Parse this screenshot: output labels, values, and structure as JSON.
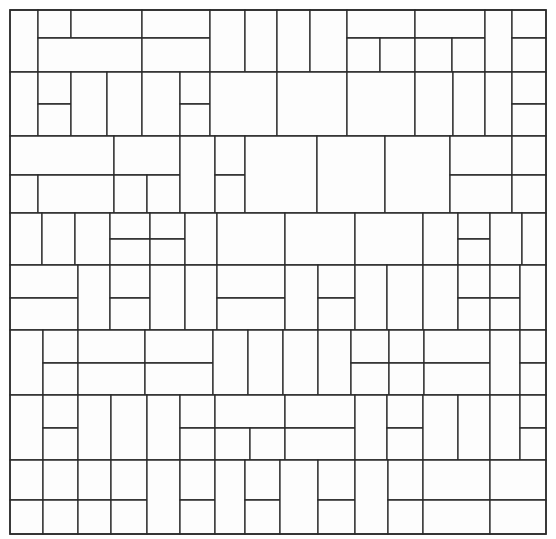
{
  "figure": {
    "kind": "rectangle-dissection",
    "title": "",
    "background_color": "#ffffff",
    "line_color": "#2b2b2b",
    "fill_color": "#fdfdfd",
    "line_width": 1.3,
    "frame_line_width": 1.6
  },
  "chart_data": {
    "type": "diagram",
    "title": "",
    "xlabel": "",
    "ylabel": "",
    "grid": false,
    "legend": null,
    "xlim": [
      10,
      546
    ],
    "ylim": [
      10,
      534
    ],
    "frame": {
      "x": 10,
      "y": 10,
      "width": 536,
      "height": 524
    },
    "row_boundaries": [
      10,
      72,
      136,
      213,
      265,
      330,
      395,
      460,
      534
    ],
    "column_boundaries": [
      10,
      38,
      71,
      142,
      210,
      245,
      277,
      310,
      347,
      415,
      485,
      512,
      546
    ],
    "rect_count": 118,
    "rectangles": [
      {
        "x": 10,
        "y": 10,
        "w": 28,
        "h": 62
      },
      {
        "x": 38,
        "y": 10,
        "w": 33,
        "h": 28
      },
      {
        "x": 71,
        "y": 10,
        "w": 71,
        "h": 28
      },
      {
        "x": 38,
        "y": 38,
        "w": 104,
        "h": 34
      },
      {
        "x": 142,
        "y": 10,
        "w": 68,
        "h": 28
      },
      {
        "x": 142,
        "y": 38,
        "w": 68,
        "h": 34
      },
      {
        "x": 210,
        "y": 10,
        "w": 35,
        "h": 62
      },
      {
        "x": 245,
        "y": 10,
        "w": 32,
        "h": 62
      },
      {
        "x": 277,
        "y": 10,
        "w": 33,
        "h": 62
      },
      {
        "x": 310,
        "y": 10,
        "w": 37,
        "h": 62
      },
      {
        "x": 347,
        "y": 10,
        "w": 68,
        "h": 28
      },
      {
        "x": 347,
        "y": 38,
        "w": 33,
        "h": 34
      },
      {
        "x": 380,
        "y": 38,
        "w": 35,
        "h": 34
      },
      {
        "x": 415,
        "y": 10,
        "w": 70,
        "h": 28
      },
      {
        "x": 415,
        "y": 38,
        "w": 37,
        "h": 34
      },
      {
        "x": 452,
        "y": 38,
        "w": 33,
        "h": 34
      },
      {
        "x": 485,
        "y": 10,
        "w": 27,
        "h": 62
      },
      {
        "x": 512,
        "y": 10,
        "w": 34,
        "h": 28
      },
      {
        "x": 512,
        "y": 38,
        "w": 34,
        "h": 34
      },
      {
        "x": 10,
        "y": 72,
        "w": 28,
        "h": 64
      },
      {
        "x": 38,
        "y": 72,
        "w": 33,
        "h": 32
      },
      {
        "x": 38,
        "y": 104,
        "w": 33,
        "h": 32
      },
      {
        "x": 71,
        "y": 72,
        "w": 36,
        "h": 64
      },
      {
        "x": 107,
        "y": 72,
        "w": 35,
        "h": 64
      },
      {
        "x": 142,
        "y": 72,
        "w": 38,
        "h": 64
      },
      {
        "x": 180,
        "y": 72,
        "w": 30,
        "h": 32
      },
      {
        "x": 180,
        "y": 104,
        "w": 30,
        "h": 32
      },
      {
        "x": 210,
        "y": 72,
        "w": 67,
        "h": 64
      },
      {
        "x": 277,
        "y": 72,
        "w": 70,
        "h": 64
      },
      {
        "x": 347,
        "y": 72,
        "w": 68,
        "h": 64
      },
      {
        "x": 415,
        "y": 72,
        "w": 38,
        "h": 64
      },
      {
        "x": 453,
        "y": 72,
        "w": 32,
        "h": 64
      },
      {
        "x": 485,
        "y": 72,
        "w": 27,
        "h": 64
      },
      {
        "x": 512,
        "y": 72,
        "w": 34,
        "h": 32
      },
      {
        "x": 512,
        "y": 104,
        "w": 34,
        "h": 32
      },
      {
        "x": 10,
        "y": 136,
        "w": 104,
        "h": 39
      },
      {
        "x": 10,
        "y": 175,
        "w": 28,
        "h": 38
      },
      {
        "x": 38,
        "y": 175,
        "w": 76,
        "h": 38
      },
      {
        "x": 114,
        "y": 136,
        "w": 66,
        "h": 39
      },
      {
        "x": 114,
        "y": 175,
        "w": 33,
        "h": 38
      },
      {
        "x": 147,
        "y": 175,
        "w": 33,
        "h": 38
      },
      {
        "x": 180,
        "y": 136,
        "w": 35,
        "h": 77
      },
      {
        "x": 215,
        "y": 136,
        "w": 30,
        "h": 39
      },
      {
        "x": 215,
        "y": 175,
        "w": 30,
        "h": 38
      },
      {
        "x": 245,
        "y": 136,
        "w": 72,
        "h": 77
      },
      {
        "x": 317,
        "y": 136,
        "w": 68,
        "h": 77
      },
      {
        "x": 385,
        "y": 136,
        "w": 65,
        "h": 77
      },
      {
        "x": 450,
        "y": 136,
        "w": 62,
        "h": 39
      },
      {
        "x": 450,
        "y": 175,
        "w": 62,
        "h": 38
      },
      {
        "x": 512,
        "y": 136,
        "w": 34,
        "h": 39
      },
      {
        "x": 512,
        "y": 175,
        "w": 34,
        "h": 38
      },
      {
        "x": 10,
        "y": 213,
        "w": 32,
        "h": 52
      },
      {
        "x": 42,
        "y": 213,
        "w": 33,
        "h": 52
      },
      {
        "x": 75,
        "y": 213,
        "w": 35,
        "h": 52
      },
      {
        "x": 110,
        "y": 213,
        "w": 40,
        "h": 26
      },
      {
        "x": 110,
        "y": 239,
        "w": 40,
        "h": 26
      },
      {
        "x": 150,
        "y": 213,
        "w": 35,
        "h": 26
      },
      {
        "x": 150,
        "y": 239,
        "w": 35,
        "h": 26
      },
      {
        "x": 185,
        "y": 213,
        "w": 32,
        "h": 52
      },
      {
        "x": 217,
        "y": 213,
        "w": 68,
        "h": 52
      },
      {
        "x": 285,
        "y": 213,
        "w": 70,
        "h": 52
      },
      {
        "x": 355,
        "y": 213,
        "w": 68,
        "h": 52
      },
      {
        "x": 423,
        "y": 213,
        "w": 35,
        "h": 52
      },
      {
        "x": 458,
        "y": 213,
        "w": 32,
        "h": 26
      },
      {
        "x": 458,
        "y": 239,
        "w": 32,
        "h": 26
      },
      {
        "x": 490,
        "y": 213,
        "w": 32,
        "h": 52
      },
      {
        "x": 522,
        "y": 213,
        "w": 24,
        "h": 52
      },
      {
        "x": 10,
        "y": 265,
        "w": 68,
        "h": 33
      },
      {
        "x": 10,
        "y": 298,
        "w": 68,
        "h": 32
      },
      {
        "x": 78,
        "y": 265,
        "w": 32,
        "h": 65
      },
      {
        "x": 110,
        "y": 265,
        "w": 40,
        "h": 33
      },
      {
        "x": 110,
        "y": 298,
        "w": 40,
        "h": 32
      },
      {
        "x": 150,
        "y": 265,
        "w": 35,
        "h": 65
      },
      {
        "x": 185,
        "y": 265,
        "w": 32,
        "h": 65
      },
      {
        "x": 217,
        "y": 265,
        "w": 68,
        "h": 33
      },
      {
        "x": 217,
        "y": 298,
        "w": 68,
        "h": 32
      },
      {
        "x": 285,
        "y": 265,
        "w": 33,
        "h": 65
      },
      {
        "x": 318,
        "y": 265,
        "w": 37,
        "h": 33
      },
      {
        "x": 318,
        "y": 298,
        "w": 37,
        "h": 32
      },
      {
        "x": 355,
        "y": 265,
        "w": 32,
        "h": 65
      },
      {
        "x": 387,
        "y": 265,
        "w": 36,
        "h": 65
      },
      {
        "x": 423,
        "y": 265,
        "w": 35,
        "h": 65
      },
      {
        "x": 458,
        "y": 265,
        "w": 32,
        "h": 33
      },
      {
        "x": 458,
        "y": 298,
        "w": 32,
        "h": 32
      },
      {
        "x": 490,
        "y": 265,
        "w": 30,
        "h": 33
      },
      {
        "x": 490,
        "y": 298,
        "w": 30,
        "h": 32
      },
      {
        "x": 520,
        "y": 265,
        "w": 26,
        "h": 65
      },
      {
        "x": 10,
        "y": 330,
        "w": 33,
        "h": 65
      },
      {
        "x": 43,
        "y": 330,
        "w": 35,
        "h": 33
      },
      {
        "x": 43,
        "y": 363,
        "w": 35,
        "h": 32
      },
      {
        "x": 78,
        "y": 330,
        "w": 67,
        "h": 33
      },
      {
        "x": 78,
        "y": 363,
        "w": 67,
        "h": 32
      },
      {
        "x": 145,
        "y": 330,
        "w": 68,
        "h": 33
      },
      {
        "x": 145,
        "y": 363,
        "w": 68,
        "h": 32
      },
      {
        "x": 213,
        "y": 330,
        "w": 35,
        "h": 65
      },
      {
        "x": 248,
        "y": 330,
        "w": 35,
        "h": 65
      },
      {
        "x": 283,
        "y": 330,
        "w": 35,
        "h": 65
      },
      {
        "x": 318,
        "y": 330,
        "w": 33,
        "h": 65
      },
      {
        "x": 351,
        "y": 330,
        "w": 38,
        "h": 33
      },
      {
        "x": 351,
        "y": 363,
        "w": 38,
        "h": 32
      },
      {
        "x": 389,
        "y": 330,
        "w": 35,
        "h": 33
      },
      {
        "x": 389,
        "y": 363,
        "w": 35,
        "h": 32
      },
      {
        "x": 424,
        "y": 330,
        "w": 66,
        "h": 33
      },
      {
        "x": 424,
        "y": 363,
        "w": 66,
        "h": 32
      },
      {
        "x": 490,
        "y": 330,
        "w": 30,
        "h": 65
      },
      {
        "x": 520,
        "y": 330,
        "w": 26,
        "h": 33
      },
      {
        "x": 520,
        "y": 363,
        "w": 26,
        "h": 32
      },
      {
        "x": 10,
        "y": 395,
        "w": 33,
        "h": 65
      },
      {
        "x": 43,
        "y": 395,
        "w": 35,
        "h": 33
      },
      {
        "x": 43,
        "y": 428,
        "w": 35,
        "h": 32
      },
      {
        "x": 78,
        "y": 395,
        "w": 33,
        "h": 65
      },
      {
        "x": 111,
        "y": 395,
        "w": 36,
        "h": 65
      },
      {
        "x": 147,
        "y": 395,
        "w": 33,
        "h": 65
      },
      {
        "x": 180,
        "y": 395,
        "w": 35,
        "h": 33
      },
      {
        "x": 180,
        "y": 428,
        "w": 35,
        "h": 32
      },
      {
        "x": 215,
        "y": 395,
        "w": 70,
        "h": 33
      },
      {
        "x": 215,
        "y": 428,
        "w": 35,
        "h": 32
      },
      {
        "x": 250,
        "y": 428,
        "w": 35,
        "h": 32
      },
      {
        "x": 285,
        "y": 395,
        "w": 70,
        "h": 33
      },
      {
        "x": 285,
        "y": 428,
        "w": 70,
        "h": 32
      },
      {
        "x": 355,
        "y": 395,
        "w": 32,
        "h": 65
      },
      {
        "x": 387,
        "y": 395,
        "w": 36,
        "h": 33
      },
      {
        "x": 387,
        "y": 428,
        "w": 36,
        "h": 32
      },
      {
        "x": 423,
        "y": 395,
        "w": 35,
        "h": 65
      },
      {
        "x": 458,
        "y": 395,
        "w": 32,
        "h": 65
      },
      {
        "x": 490,
        "y": 395,
        "w": 30,
        "h": 65
      },
      {
        "x": 520,
        "y": 395,
        "w": 26,
        "h": 33
      },
      {
        "x": 520,
        "y": 428,
        "w": 26,
        "h": 32
      },
      {
        "x": 10,
        "y": 460,
        "w": 33,
        "h": 40
      },
      {
        "x": 10,
        "y": 500,
        "w": 33,
        "h": 34
      },
      {
        "x": 43,
        "y": 460,
        "w": 35,
        "h": 40
      },
      {
        "x": 43,
        "y": 500,
        "w": 35,
        "h": 34
      },
      {
        "x": 78,
        "y": 460,
        "w": 33,
        "h": 40
      },
      {
        "x": 78,
        "y": 500,
        "w": 33,
        "h": 34
      },
      {
        "x": 111,
        "y": 460,
        "w": 36,
        "h": 40
      },
      {
        "x": 111,
        "y": 500,
        "w": 36,
        "h": 34
      },
      {
        "x": 147,
        "y": 460,
        "w": 33,
        "h": 74
      },
      {
        "x": 180,
        "y": 460,
        "w": 35,
        "h": 40
      },
      {
        "x": 180,
        "y": 500,
        "w": 35,
        "h": 34
      },
      {
        "x": 215,
        "y": 460,
        "w": 30,
        "h": 74
      },
      {
        "x": 245,
        "y": 460,
        "w": 35,
        "h": 40
      },
      {
        "x": 245,
        "y": 500,
        "w": 35,
        "h": 34
      },
      {
        "x": 280,
        "y": 460,
        "w": 38,
        "h": 74
      },
      {
        "x": 318,
        "y": 460,
        "w": 37,
        "h": 40
      },
      {
        "x": 318,
        "y": 500,
        "w": 37,
        "h": 34
      },
      {
        "x": 355,
        "y": 460,
        "w": 33,
        "h": 74
      },
      {
        "x": 388,
        "y": 460,
        "w": 35,
        "h": 40
      },
      {
        "x": 388,
        "y": 500,
        "w": 35,
        "h": 34
      },
      {
        "x": 423,
        "y": 460,
        "w": 67,
        "h": 40
      },
      {
        "x": 423,
        "y": 500,
        "w": 67,
        "h": 34
      },
      {
        "x": 490,
        "y": 460,
        "w": 56,
        "h": 40
      },
      {
        "x": 490,
        "y": 500,
        "w": 56,
        "h": 34
      }
    ]
  }
}
